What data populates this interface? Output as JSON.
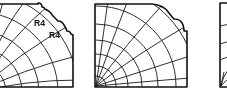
{
  "figure": {
    "panels": [
      {
        "id": "panel-1",
        "profile": "stepped corner with two rounded fillets",
        "labels": [
          "R4",
          "R4"
        ]
      },
      {
        "id": "panel-2",
        "profile": "large rounded corner with small secondary fillet",
        "labels": []
      },
      {
        "id": "panel-3",
        "profile": "partially visible rectangular profile (cropped)",
        "labels": []
      }
    ]
  },
  "colors": {
    "ink": "#111111",
    "background": "#ffffff"
  }
}
